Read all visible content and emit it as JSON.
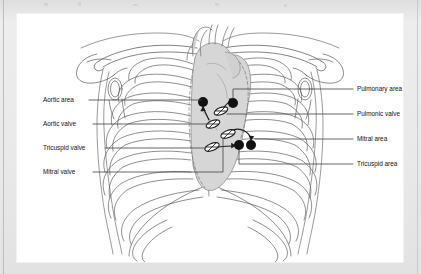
{
  "figure": {
    "labels_left": [
      {
        "id": "aortic-area",
        "text": "Aortic area",
        "marker": "dot",
        "text_x": 26,
        "text_y": 88,
        "leader_x1": 72,
        "leader_y1": 86,
        "leader_x2": 184,
        "leader_y2": 86,
        "target_x": 186,
        "target_y": 88
      },
      {
        "id": "aortic-valve",
        "text": "Aortic valve",
        "marker": "oval",
        "text_x": 26,
        "text_y": 112,
        "leader_x1": 76,
        "leader_y1": 110,
        "leader_x2": 192,
        "leader_y2": 110,
        "target_x": 196,
        "target_y": 110
      },
      {
        "id": "tricuspid-valve",
        "text": "Tricuspid valve",
        "marker": "oval",
        "text_x": 26,
        "text_y": 136,
        "leader_x1": 88,
        "leader_y1": 134,
        "leader_x2": 190,
        "leader_y2": 134,
        "target_x": 194,
        "target_y": 133
      },
      {
        "id": "mitral-valve",
        "text": "Mitral valve",
        "marker": "oval",
        "text_x": 26,
        "text_y": 160,
        "leader_x1": 76,
        "leader_y1": 158,
        "leader_x2": 206,
        "leader_y2": 158,
        "target_x": 210,
        "target_y": 120
      }
    ],
    "labels_right": [
      {
        "id": "pulmonary-area",
        "text": "Pulmonary area",
        "marker": "dot",
        "text_x": 338,
        "text_y": 77,
        "leader_x1": 336,
        "leader_y1": 75,
        "leader_x2": 216,
        "leader_y2": 75,
        "target_x": 216,
        "target_y": 89
      },
      {
        "id": "pulmonic-valve",
        "text": "Pulmonic valve",
        "marker": "oval",
        "text_x": 338,
        "text_y": 102,
        "leader_x1": 336,
        "leader_y1": 100,
        "leader_x2": 208,
        "leader_y2": 100,
        "target_x": 206,
        "target_y": 97
      },
      {
        "id": "mitral-area",
        "text": "Mitral area",
        "marker": "dot",
        "text_x": 338,
        "text_y": 127,
        "leader_x1": 336,
        "leader_y1": 125,
        "leader_x2": 234,
        "leader_y2": 125,
        "target_x": 234,
        "target_y": 131
      },
      {
        "id": "tricuspid-area",
        "text": "Tricuspid area",
        "marker": "dot",
        "text_x": 338,
        "text_y": 152,
        "leader_x1": 336,
        "leader_y1": 150,
        "leader_x2": 222,
        "leader_y2": 150,
        "target_x": 222,
        "target_y": 132
      }
    ],
    "auscultation_points": [
      {
        "id": "aortic-area-point",
        "name": "Aortic area",
        "x": 186,
        "y": 88,
        "r": 5.0
      },
      {
        "id": "pulmonary-area-point",
        "name": "Pulmonary area",
        "x": 216,
        "y": 89,
        "r": 5.0
      },
      {
        "id": "tricuspid-area-point",
        "name": "Tricuspid area",
        "x": 222,
        "y": 131,
        "r": 5.0
      },
      {
        "id": "mitral-area-point",
        "name": "Mitral area",
        "x": 234,
        "y": 131,
        "r": 5.0
      }
    ],
    "valve_ovals": [
      {
        "id": "pulmonic-valve-oval",
        "name": "Pulmonic valve",
        "x": 204,
        "y": 97,
        "rx": 7.2,
        "ry": 3.4,
        "rot": -22
      },
      {
        "id": "aortic-valve-oval",
        "name": "Aortic valve",
        "x": 196,
        "y": 110,
        "rx": 7.2,
        "ry": 3.4,
        "rot": -22
      },
      {
        "id": "mitral-valve-oval",
        "name": "Mitral valve",
        "x": 211,
        "y": 120,
        "rx": 7.6,
        "ry": 3.6,
        "rot": -22
      },
      {
        "id": "tricuspid-valve-oval",
        "name": "Tricuspid valve",
        "x": 195,
        "y": 133,
        "rx": 7.6,
        "ry": 3.6,
        "rot": -22
      }
    ],
    "colors": {
      "page_frame": "#e6e6e6",
      "plate": "#ffffff",
      "ink": "#3a3a3a",
      "label_text": "#111111",
      "leader_line": "#4a4a4a",
      "heart_fill": "#d6d6d6",
      "heart_outline": "#8a8a8a",
      "marker_fill": "#111111",
      "valve_fill": "#ffffff"
    }
  }
}
